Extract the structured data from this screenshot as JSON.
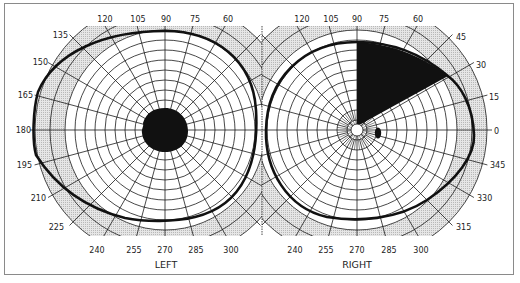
{
  "figure": {
    "type": "visual-field-perimetry-chart",
    "colors": {
      "background": "#ffffff",
      "frame": "#8a8a8a",
      "grid": "#1a1a1a",
      "shaded_band": "#d9d9d9",
      "field_boundary": "#111111",
      "defect_fill": "#111111"
    },
    "left_eye": {
      "label": "LEFT",
      "angle_labels": [
        "120",
        "105",
        "90",
        "75",
        "60",
        "135",
        "150",
        "165",
        "180",
        "195",
        "210",
        "225",
        "240",
        "255",
        "270",
        "285",
        "300"
      ],
      "defects": [
        {
          "name": "central-scotoma",
          "shape": "circle",
          "description": "large dense central blind spot"
        }
      ]
    },
    "right_eye": {
      "label": "RIGHT",
      "angle_labels": [
        "120",
        "105",
        "90",
        "75",
        "60",
        "45",
        "30",
        "15",
        "0",
        "345",
        "330",
        "315",
        "240",
        "255",
        "270",
        "285",
        "300"
      ],
      "defects": [
        {
          "name": "superior-nasal-sector-defect",
          "shape": "sector",
          "from_angle": 30,
          "to_angle": 90,
          "description": "wedge defect from 90° to ~30° upper quadrant"
        },
        {
          "name": "blind-spot",
          "shape": "ellipse",
          "description": "small physiological blind spot temporal to fixation"
        }
      ]
    }
  },
  "labels": {
    "l120": "120",
    "l105": "105",
    "l90": "90",
    "l75": "75",
    "l60": "60",
    "l135": "135",
    "l150": "150",
    "l165": "165",
    "l180": "180",
    "l195": "195",
    "l210": "210",
    "l225": "225",
    "l240": "240",
    "l255": "255",
    "l270": "270",
    "l285": "285",
    "l300": "300",
    "left": "LEFT",
    "r120": "120",
    "r105": "105",
    "r90": "90",
    "r75": "75",
    "r60": "60",
    "r45": "45",
    "r30": "30",
    "r15": "15",
    "r0": "0",
    "r345": "345",
    "r330": "330",
    "r315": "315",
    "r240": "240",
    "r255": "255",
    "r270": "270",
    "r285": "285",
    "r300": "300",
    "right": "RIGHT"
  }
}
